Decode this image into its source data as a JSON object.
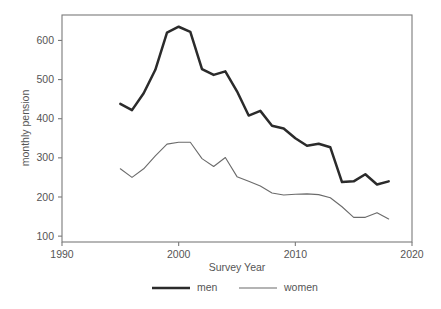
{
  "chart_data": {
    "type": "line",
    "title": "",
    "xlabel": "Survey Year",
    "ylabel": "monthly pension",
    "xlim": [
      1990,
      2020
    ],
    "ylim": [
      85,
      665
    ],
    "grid": false,
    "legend_position": "bottom",
    "x_ticks": [
      "1990",
      "2000",
      "2010",
      "2020"
    ],
    "x_tick_values": [
      1990,
      2000,
      2010,
      2020
    ],
    "y_ticks": [
      "100",
      "200",
      "300",
      "400",
      "500",
      "600"
    ],
    "y_tick_values": [
      100,
      200,
      300,
      400,
      500,
      600
    ],
    "x": [
      1995,
      1996,
      1997,
      1998,
      1999,
      2000,
      2001,
      2002,
      2003,
      2004,
      2005,
      2006,
      2007,
      2008,
      2009,
      2010,
      2011,
      2012,
      2013,
      2014,
      2015,
      2016,
      2017,
      2018
    ],
    "series": [
      {
        "name": "men",
        "color": "#2b2b2b",
        "line_width": "thick",
        "values": [
          438,
          422,
          465,
          525,
          620,
          635,
          622,
          527,
          512,
          521,
          470,
          408,
          420,
          382,
          375,
          350,
          331,
          336,
          327,
          238,
          240,
          258,
          232,
          240
        ]
      },
      {
        "name": "women",
        "color": "#6b6b6b",
        "line_width": "thin",
        "values": [
          272,
          250,
          272,
          305,
          335,
          340,
          340,
          298,
          278,
          301,
          252,
          240,
          228,
          210,
          205,
          207,
          208,
          206,
          198,
          175,
          148,
          148,
          160,
          144
        ]
      }
    ]
  },
  "legend": {
    "entries": [
      {
        "label": "men"
      },
      {
        "label": "women"
      }
    ]
  },
  "axes": {
    "x_title": "Survey Year",
    "y_title": "monthly pension"
  }
}
